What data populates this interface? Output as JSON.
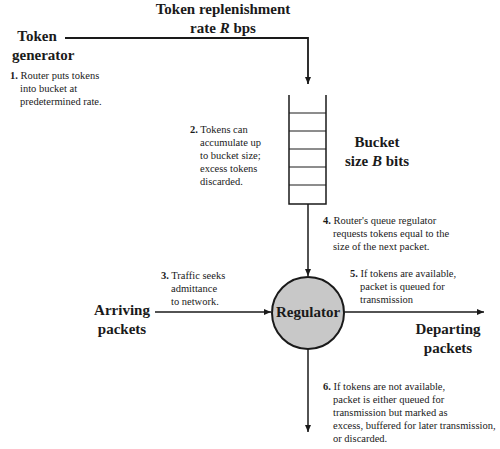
{
  "diagram": {
    "title_top": {
      "line1": "Token replenishment",
      "line2_prefix": "rate ",
      "line2_var": "R",
      "line2_suffix": " bps"
    },
    "token_generator": {
      "line1": "Token",
      "line2": "generator"
    },
    "bucket_label": {
      "line1": "Bucket",
      "line2_prefix": "size ",
      "line2_var": "B",
      "line2_suffix": " bits"
    },
    "arriving_packets": {
      "line1": "Arriving",
      "line2": "packets"
    },
    "regulator": {
      "label": "Regulator",
      "fill": "#c8c8c8"
    },
    "departing_packets": {
      "line1": "Departing",
      "line2": "packets"
    },
    "steps": [
      {
        "num": "1.",
        "lines": [
          "Router puts tokens",
          "into bucket at",
          "predetermined rate."
        ]
      },
      {
        "num": "2.",
        "lines": [
          "Tokens can",
          "accumulate up",
          "to bucket size;",
          "excess tokens",
          "discarded."
        ]
      },
      {
        "num": "3.",
        "lines": [
          "Traffic seeks",
          "admittance",
          "to network."
        ]
      },
      {
        "num": "4.",
        "lines": [
          "Router's queue regulator",
          "requests tokens equal to the",
          "size of the next packet."
        ]
      },
      {
        "num": "5.",
        "lines": [
          "If tokens are available,",
          "packet is queued for",
          "transmission"
        ]
      },
      {
        "num": "6.",
        "lines": [
          "If tokens are not available,",
          "packet is either queued for",
          "transmission but marked as",
          "excess, buffered for later transmission,",
          "or discarded."
        ]
      }
    ],
    "bucket_slots": 6
  }
}
